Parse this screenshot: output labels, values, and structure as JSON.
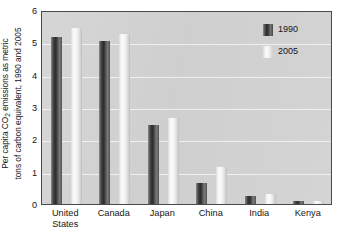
{
  "chart_data": {
    "type": "bar",
    "title": "",
    "subtitle": "",
    "xlabel": "",
    "ylabel_line1": "Per capita CO",
    "ylabel_sub": "2",
    "ylabel_line1_rest": " emissions as metric",
    "ylabel_line2": "tons of carbon equivalent, 1990 and 2005",
    "categories": [
      "United States",
      "Canada",
      "Japan",
      "China",
      "India",
      "Kenya"
    ],
    "category_lines": [
      [
        "United",
        "States"
      ],
      [
        "Canada",
        ""
      ],
      [
        "Japan",
        ""
      ],
      [
        "China",
        ""
      ],
      [
        "India",
        ""
      ],
      [
        "Kenya",
        ""
      ]
    ],
    "series": [
      {
        "name": "1990",
        "values": [
          5.15,
          5.05,
          2.45,
          0.65,
          0.25,
          0.1
        ],
        "color": "#333333"
      },
      {
        "name": "2005",
        "values": [
          5.45,
          5.25,
          2.65,
          1.15,
          0.3,
          0.08
        ],
        "color": "#f2f2f2"
      }
    ],
    "ylim": [
      0,
      6
    ],
    "ytick_values": [
      6,
      5,
      4,
      3,
      2,
      1,
      0
    ],
    "ytick_labels": [
      "6",
      "5",
      "4",
      "3",
      "2",
      "1",
      "0"
    ],
    "grid": true,
    "grid_color": "#f2f2f2",
    "legend_position": "top-right",
    "plot_background": "#d2d2d2",
    "axis_color": "#4a4a4a"
  },
  "legend": {
    "entries": [
      {
        "label": "1990",
        "swatch": "dark-gradient-swatch"
      },
      {
        "label": "2005",
        "swatch": "light-gradient-swatch"
      }
    ]
  }
}
